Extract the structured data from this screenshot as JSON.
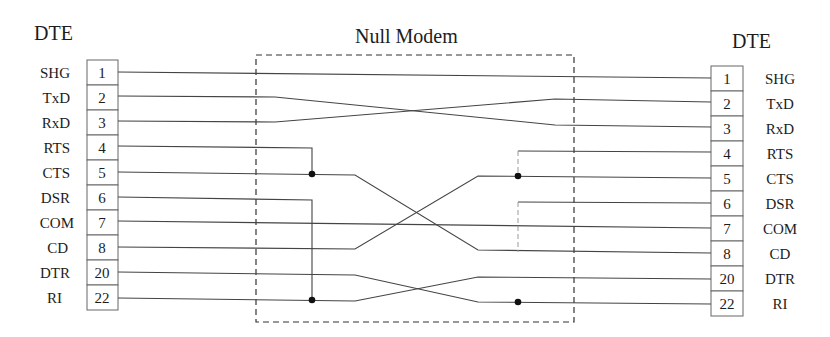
{
  "titles": {
    "left": "DTE",
    "center": "Null Modem",
    "right": "DTE"
  },
  "left_connector": {
    "pins": [
      {
        "signal": "SHG",
        "pin": "1"
      },
      {
        "signal": "TxD",
        "pin": "2"
      },
      {
        "signal": "RxD",
        "pin": "3"
      },
      {
        "signal": "RTS",
        "pin": "4"
      },
      {
        "signal": "CTS",
        "pin": "5"
      },
      {
        "signal": "DSR",
        "pin": "6"
      },
      {
        "signal": "COM",
        "pin": "7"
      },
      {
        "signal": "CD",
        "pin": "8"
      },
      {
        "signal": "DTR",
        "pin": "20"
      },
      {
        "signal": "RI",
        "pin": "22"
      }
    ]
  },
  "right_connector": {
    "pins": [
      {
        "signal": "SHG",
        "pin": "1"
      },
      {
        "signal": "TxD",
        "pin": "2"
      },
      {
        "signal": "RxD",
        "pin": "3"
      },
      {
        "signal": "RTS",
        "pin": "4"
      },
      {
        "signal": "CTS",
        "pin": "5"
      },
      {
        "signal": "DSR",
        "pin": "6"
      },
      {
        "signal": "COM",
        "pin": "7"
      },
      {
        "signal": "CD",
        "pin": "8"
      },
      {
        "signal": "DTR",
        "pin": "20"
      },
      {
        "signal": "RI",
        "pin": "22"
      }
    ]
  },
  "connections": [
    {
      "from": "L:SHG(1)",
      "to": "R:SHG(1)",
      "type": "straight"
    },
    {
      "from": "L:TxD(2)",
      "to": "R:RxD(3)",
      "type": "crossed"
    },
    {
      "from": "L:RxD(3)",
      "to": "R:TxD(2)",
      "type": "crossed"
    },
    {
      "from": "L:RTS(4)",
      "to": "L:CTS(5)",
      "type": "loopback-junction"
    },
    {
      "from": "L:CTS(5)",
      "to": "R:CD(8)",
      "type": "crossed"
    },
    {
      "from": "L:DSR(6)",
      "to": "L:RI(22)",
      "type": "loopback-junction"
    },
    {
      "from": "L:COM(7)",
      "to": "R:COM(7)",
      "type": "straight"
    },
    {
      "from": "L:CD(8)",
      "to": "R:CTS(5)",
      "type": "crossed"
    },
    {
      "from": "L:DTR(20)",
      "to": "R:RI(22)",
      "type": "crossed"
    },
    {
      "from": "L:RI(22)",
      "to": "R:DTR(20)",
      "type": "crossed"
    },
    {
      "from": "R:RTS(4)",
      "to": "R:CTS(5)",
      "type": "loopback-junction"
    },
    {
      "from": "R:DSR(6)",
      "to": "R:CD(8)",
      "type": "loopback-faint"
    }
  ]
}
